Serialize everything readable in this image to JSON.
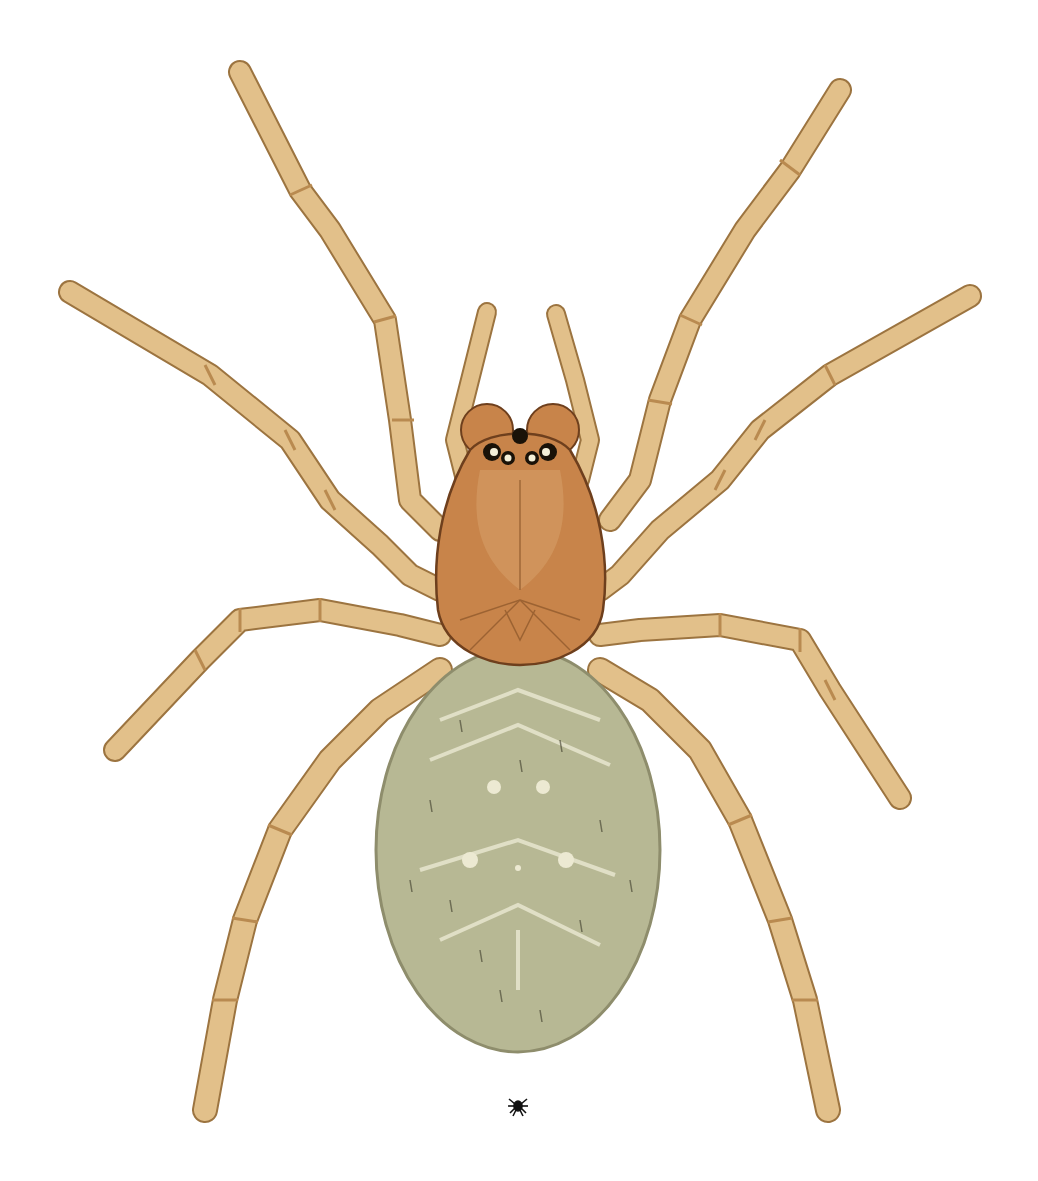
{
  "image": {
    "subject": "spider illustration",
    "description": "Dorsal view scientific illustration of a spider with pale straw-colored legs, brown carapace and grey-green oval abdomen",
    "scale_icon": "small-spider-scale-icon"
  },
  "colors": {
    "background": "#ffffff",
    "leg": "#e2c08a",
    "leg_dark": "#c99a5a",
    "leg_outline": "#9c7440",
    "carapace": "#c8844a",
    "carapace_dark": "#a3622f",
    "carapace_outline": "#6e3f1d",
    "abdomen": "#b7b894",
    "abdomen_outline": "#8e8d6c",
    "abdomen_mark": "#e8e6cf",
    "eye": "#1a1208",
    "scale_icon": "#111111"
  }
}
